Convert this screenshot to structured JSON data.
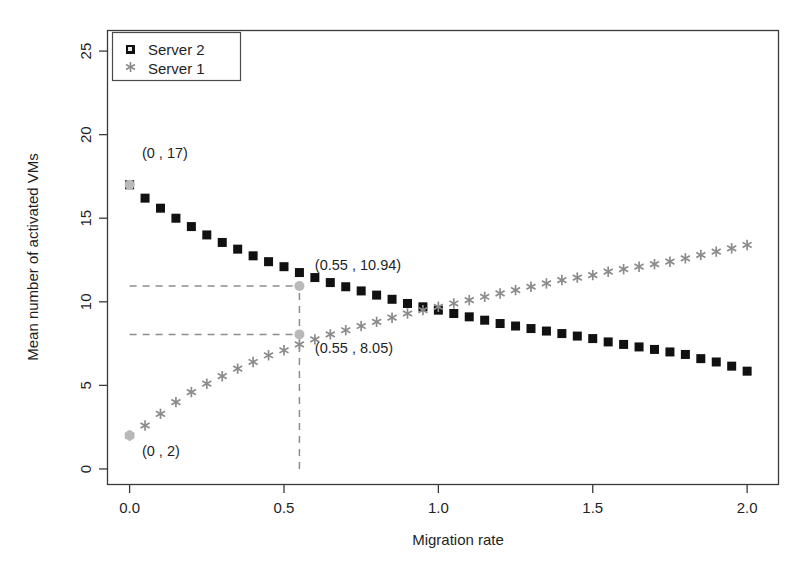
{
  "chart_data": {
    "type": "scatter",
    "title": "",
    "xlabel": "Migration rate",
    "ylabel": "Mean number of activated VMs",
    "xlim": [
      -0.07,
      2.1
    ],
    "ylim": [
      -0.9,
      26.2
    ],
    "xticks": [
      0.0,
      0.5,
      1.0,
      1.5,
      2.0
    ],
    "xticklabels": [
      "0.0",
      "0.5",
      "1.0",
      "1.5",
      "2.0"
    ],
    "yticks": [
      0,
      5,
      10,
      15,
      20,
      25
    ],
    "yticklabels": [
      "0",
      "5",
      "10",
      "15",
      "20",
      "25"
    ],
    "grid": false,
    "legend_position": "top-left",
    "x": [
      0.0,
      0.05,
      0.1,
      0.15,
      0.2,
      0.25,
      0.3,
      0.35,
      0.4,
      0.45,
      0.5,
      0.55,
      0.6,
      0.65,
      0.7,
      0.75,
      0.8,
      0.85,
      0.9,
      0.95,
      1.0,
      1.05,
      1.1,
      1.15,
      1.2,
      1.25,
      1.3,
      1.35,
      1.4,
      1.45,
      1.5,
      1.55,
      1.6,
      1.65,
      1.7,
      1.75,
      1.8,
      1.85,
      1.9,
      1.95,
      2.0
    ],
    "series": [
      {
        "name": "Server 2",
        "marker": "square",
        "color": "#111111",
        "values": [
          17.0,
          16.2,
          15.6,
          15.0,
          14.5,
          14.0,
          13.55,
          13.15,
          12.75,
          12.4,
          12.1,
          11.75,
          11.45,
          11.15,
          10.9,
          10.65,
          10.4,
          10.15,
          9.9,
          9.7,
          9.5,
          9.3,
          9.1,
          8.9,
          8.7,
          8.55,
          8.4,
          8.25,
          8.1,
          7.95,
          7.8,
          7.6,
          7.45,
          7.3,
          7.15,
          7.0,
          6.85,
          6.6,
          6.4,
          6.15,
          5.85
        ]
      },
      {
        "name": "Server 1",
        "marker": "asterisk",
        "color": "#8b8b8b",
        "values": [
          2.0,
          2.6,
          3.3,
          4.0,
          4.6,
          5.1,
          5.55,
          6.0,
          6.4,
          6.8,
          7.1,
          7.45,
          7.75,
          8.05,
          8.3,
          8.55,
          8.8,
          9.05,
          9.3,
          9.5,
          9.7,
          9.9,
          10.1,
          10.3,
          10.5,
          10.7,
          10.9,
          11.1,
          11.3,
          11.45,
          11.6,
          11.8,
          11.95,
          12.1,
          12.25,
          12.4,
          12.6,
          12.8,
          13.0,
          13.2,
          13.4
        ]
      }
    ],
    "annotations": [
      {
        "text": "(0 , 17)",
        "x": 0.0,
        "y": 17.0,
        "label_x": 0.04,
        "label_y": 18.6,
        "marker": "gray-dot"
      },
      {
        "text": "(0 , 2)",
        "x": 0.0,
        "y": 2.0,
        "label_x": 0.04,
        "label_y": 0.75,
        "marker": "gray-dot"
      },
      {
        "text": "(0.55 , 10.94)",
        "x": 0.55,
        "y": 10.94,
        "label_x": 0.6,
        "label_y": 11.9,
        "marker": "gray-dot"
      },
      {
        "text": "(0.55 , 8.05)",
        "x": 0.55,
        "y": 8.05,
        "label_x": 0.6,
        "label_y": 6.95,
        "marker": "gray-dot"
      }
    ],
    "guide_lines": [
      {
        "type": "horizontal",
        "y": 10.94,
        "from_x": 0.0,
        "to_x": 0.55
      },
      {
        "type": "horizontal",
        "y": 8.05,
        "from_x": 0.0,
        "to_x": 0.55
      },
      {
        "type": "vertical",
        "x": 0.55,
        "from_y": 0.0,
        "to_y": 10.94
      }
    ]
  },
  "legend": {
    "items": [
      {
        "label": "Server 2",
        "marker": "square"
      },
      {
        "label": "Server 1",
        "marker": "asterisk"
      }
    ]
  }
}
